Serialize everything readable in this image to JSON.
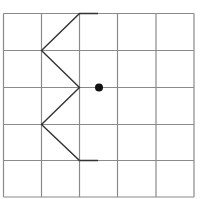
{
  "diagram": {
    "type": "grid-figure",
    "grid": {
      "rows": 5,
      "cols": 5,
      "x_lines": [
        3.5,
        41.5,
        79.5,
        117.5,
        156,
        194
      ],
      "y_lines": [
        13.5,
        50.5,
        87.5,
        124.5,
        160.5,
        197
      ],
      "line_color": "#8a8a8a"
    },
    "shape": {
      "points": [
        [
          98,
          13.5
        ],
        [
          79.5,
          13.5
        ],
        [
          41.5,
          50.5
        ],
        [
          79.5,
          87.5
        ],
        [
          41.5,
          124.5
        ],
        [
          79.5,
          160.5
        ],
        [
          98,
          160.5
        ]
      ],
      "color": "#333333"
    },
    "dot": {
      "cx": 99,
      "cy": 87.5,
      "r": 4,
      "color": "#111111"
    }
  }
}
